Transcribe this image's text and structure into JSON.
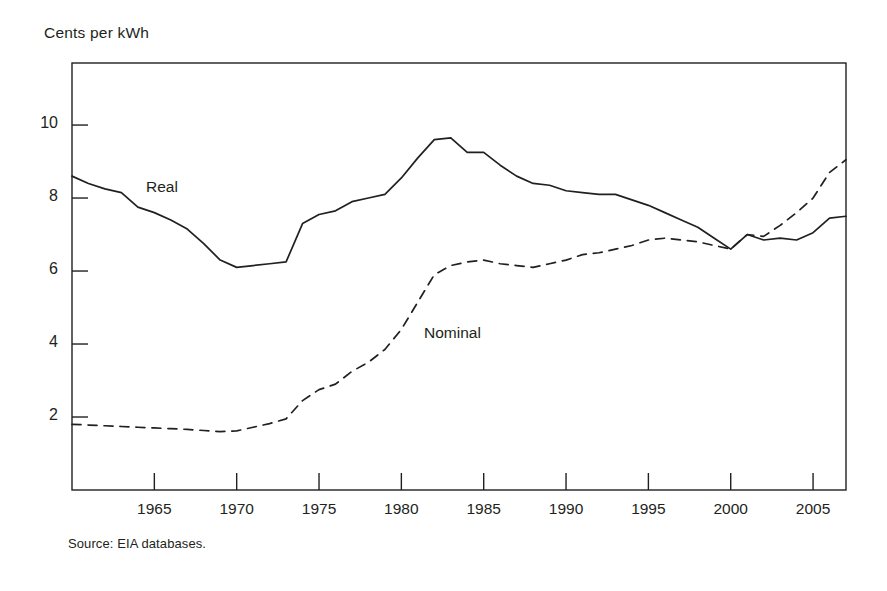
{
  "figure": {
    "y_axis_title": "Cents per kWh",
    "source_note": "Source: EIA databases."
  },
  "chart_data": {
    "type": "line",
    "title": "",
    "xlabel": "",
    "ylabel": "Cents per kWh",
    "xlim": [
      1960,
      2007
    ],
    "ylim": [
      0,
      11.7
    ],
    "grid": false,
    "legend": "inline-annotations",
    "x_ticks": [
      1965,
      1970,
      1975,
      1980,
      1985,
      1990,
      1995,
      2000,
      2005
    ],
    "y_ticks": [
      2,
      4,
      6,
      8,
      10
    ],
    "x": [
      1960,
      1961,
      1962,
      1963,
      1964,
      1965,
      1966,
      1967,
      1968,
      1969,
      1970,
      1971,
      1972,
      1973,
      1974,
      1975,
      1976,
      1977,
      1978,
      1979,
      1980,
      1981,
      1982,
      1983,
      1984,
      1985,
      1986,
      1987,
      1988,
      1989,
      1990,
      1991,
      1992,
      1993,
      1994,
      1995,
      1996,
      1997,
      1998,
      1999,
      2000,
      2001,
      2002,
      2003,
      2004,
      2005,
      2006,
      2007
    ],
    "series": [
      {
        "name": "Real",
        "style": "solid",
        "color": "#231f20",
        "annotation": "Real",
        "values": [
          8.6,
          8.4,
          8.25,
          8.15,
          7.75,
          7.6,
          7.4,
          7.15,
          6.75,
          6.3,
          6.1,
          6.15,
          6.2,
          6.25,
          7.3,
          7.55,
          7.65,
          7.9,
          8.0,
          8.1,
          8.55,
          9.1,
          9.6,
          9.65,
          9.25,
          9.25,
          8.9,
          8.6,
          8.4,
          8.35,
          8.2,
          8.15,
          8.1,
          8.1,
          7.95,
          7.8,
          7.6,
          7.4,
          7.2,
          6.9,
          6.6,
          7.0,
          6.85,
          6.9,
          6.85,
          7.05,
          7.45,
          7.5
        ]
      },
      {
        "name": "Nominal",
        "style": "dashed",
        "color": "#231f20",
        "annotation": "Nominal",
        "values": [
          1.8,
          1.78,
          1.76,
          1.74,
          1.72,
          1.7,
          1.68,
          1.66,
          1.63,
          1.6,
          1.62,
          1.72,
          1.82,
          1.95,
          2.45,
          2.75,
          2.9,
          3.25,
          3.5,
          3.85,
          4.4,
          5.15,
          5.9,
          6.15,
          6.25,
          6.3,
          6.2,
          6.15,
          6.1,
          6.2,
          6.3,
          6.45,
          6.5,
          6.6,
          6.7,
          6.85,
          6.9,
          6.85,
          6.8,
          6.7,
          6.6,
          7.0,
          6.95,
          7.25,
          7.6,
          8.0,
          8.7,
          9.05
        ]
      }
    ]
  }
}
